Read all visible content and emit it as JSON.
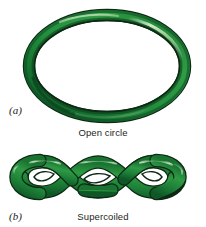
{
  "figure": {
    "background_color": "#ffffff",
    "width": 206,
    "height": 227
  },
  "panel_a": {
    "label": "(a)",
    "caption": "Open circle",
    "shape_name": "open-circle-torus",
    "colors": {
      "outline": "#0d2a14",
      "dark_green": "#0f5a28",
      "mid_green": "#1f8a3c",
      "light_green": "#57b05f",
      "highlight": "#c9e6c0"
    }
  },
  "panel_b": {
    "label": "(b)",
    "caption": "Supercoiled",
    "shape_name": "supercoiled-plectoneme",
    "crossings": 4,
    "colors": {
      "outline": "#0d2a14",
      "dark_green": "#0f5a28",
      "mid_green": "#1f8a3c",
      "light_green": "#57b05f",
      "highlight": "#c9e6c0"
    }
  }
}
